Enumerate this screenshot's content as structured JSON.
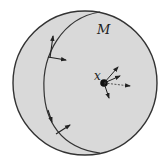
{
  "diagram": {
    "manifold_label": "M",
    "point_label": "x",
    "colors": {
      "fill": "#d9d9d9",
      "stroke": "#333333",
      "background": "#ffffff"
    },
    "elements": [
      {
        "type": "disk",
        "label": "M",
        "description": "shaded manifold region"
      },
      {
        "type": "boundary-curve",
        "description": "curve inside M with tangent and normal vectors"
      },
      {
        "type": "point",
        "label": "x",
        "description": "interior point with several tangent vectors"
      }
    ]
  }
}
